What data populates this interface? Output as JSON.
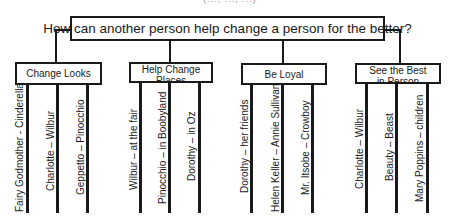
{
  "diagram": {
    "type": "tree-map",
    "top_fragment": "(..., ..., ...)",
    "root": "How can another person help change a person for the better?",
    "branches": [
      {
        "label": "Change Looks",
        "leaves": [
          "Fairy Godmother - Cinderella",
          "Charlotte – Wilbur",
          "Geppetto – Pinocchio"
        ]
      },
      {
        "label": "Help Change Places",
        "leaves": [
          "Wilbur – at the fair",
          "Pinocchio – in Boobyland",
          "Dorothy – in Oz"
        ]
      },
      {
        "label": "Be Loyal",
        "leaves": [
          "Dorothy – her friends",
          "Helen Keller – Annie Sullivan",
          "Mr. Itsobe – Crowboy"
        ]
      },
      {
        "label": "See the Best in Person",
        "leaves": [
          "Charlotte – Wilbur",
          "Beauty – Beast",
          "Mary Poppins – children"
        ]
      }
    ]
  }
}
